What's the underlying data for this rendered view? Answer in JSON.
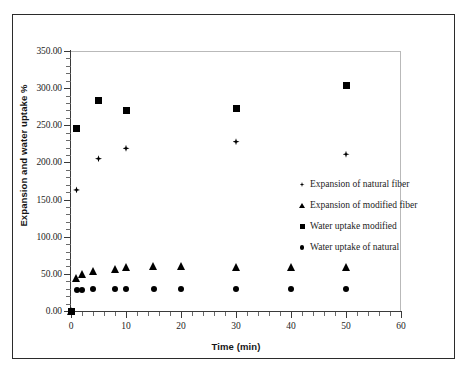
{
  "chart_data": {
    "type": "scatter",
    "title": "",
    "xlabel": "Time (min)",
    "ylabel": "Expansion and water uptake %",
    "xlim": [
      0,
      60
    ],
    "ylim": [
      0,
      350
    ],
    "xticks": [
      0,
      10,
      20,
      30,
      40,
      50,
      60
    ],
    "xtick_labels": [
      "0",
      "10",
      "20",
      "30",
      "40",
      "50",
      "60"
    ],
    "yticks": [
      0,
      50,
      100,
      150,
      200,
      250,
      300,
      350
    ],
    "ytick_labels": [
      "0.00",
      "50.00",
      "100.00",
      "150.00",
      "200.00",
      "250.00",
      "300.00",
      "350.00"
    ],
    "grid": false,
    "legend_position": "center-right",
    "marker_color": "#000000",
    "series": [
      {
        "name": "Expansion of natural fiber",
        "marker": "circle",
        "points": [
          {
            "x": 0,
            "y": 0
          },
          {
            "x": 1,
            "y": 28
          },
          {
            "x": 2,
            "y": 28
          },
          {
            "x": 4,
            "y": 29
          },
          {
            "x": 8,
            "y": 29
          },
          {
            "x": 10,
            "y": 29
          },
          {
            "x": 15,
            "y": 29
          },
          {
            "x": 20,
            "y": 29
          },
          {
            "x": 30,
            "y": 29
          },
          {
            "x": 40,
            "y": 29
          },
          {
            "x": 50,
            "y": 29
          }
        ]
      },
      {
        "name": "Expansion of modified fiber",
        "marker": "triangle",
        "points": [
          {
            "x": 0,
            "y": 0
          },
          {
            "x": 1,
            "y": 44
          },
          {
            "x": 2,
            "y": 50
          },
          {
            "x": 4,
            "y": 54
          },
          {
            "x": 8,
            "y": 57
          },
          {
            "x": 10,
            "y": 59
          },
          {
            "x": 15,
            "y": 60
          },
          {
            "x": 20,
            "y": 60
          },
          {
            "x": 30,
            "y": 59
          },
          {
            "x": 40,
            "y": 59
          },
          {
            "x": 50,
            "y": 59
          }
        ]
      },
      {
        "name": "Water uptake modified",
        "marker": "square",
        "points": [
          {
            "x": 0,
            "y": 0
          },
          {
            "x": 1,
            "y": 246
          },
          {
            "x": 5,
            "y": 283
          },
          {
            "x": 10,
            "y": 270
          },
          {
            "x": 30,
            "y": 273
          },
          {
            "x": 50,
            "y": 303
          }
        ]
      },
      {
        "name": "Water uptake of natural",
        "marker": "diamond",
        "points": [
          {
            "x": 1,
            "y": 163
          },
          {
            "x": 5,
            "y": 205
          },
          {
            "x": 10,
            "y": 219
          },
          {
            "x": 30,
            "y": 228
          },
          {
            "x": 50,
            "y": 211
          }
        ]
      }
    ],
    "legend": [
      {
        "label": "Expansion of natural fiber",
        "marker": "diamond"
      },
      {
        "label": "Expansion of modified fiber",
        "marker": "triangle"
      },
      {
        "label": "Water uptake modified",
        "marker": "square"
      },
      {
        "label": "Water uptake of natural",
        "marker": "circle"
      }
    ]
  }
}
